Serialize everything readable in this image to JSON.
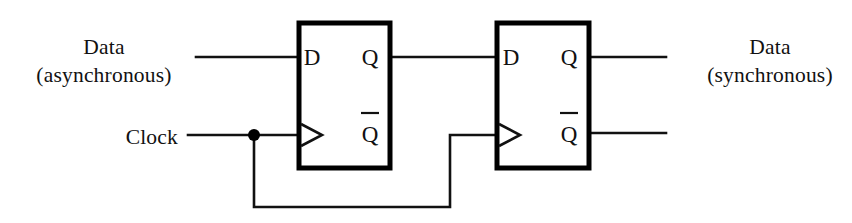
{
  "figure": {
    "type": "logic-circuit-schematic",
    "background_color": "#ffffff",
    "line_color": "#111111"
  },
  "labels": {
    "data_async": {
      "line1": "Data",
      "line2": "(asynchronous)"
    },
    "clock": "Clock",
    "data_sync": {
      "line1": "Data",
      "line2": "(synchronous)"
    }
  },
  "flipflops": [
    {
      "id": "ff1",
      "name": "first-flip-flop",
      "pins": {
        "d": "D",
        "q": "Q",
        "qbar": "Q",
        "qbar_overbar": true,
        "clock": "clock-triangle"
      }
    },
    {
      "id": "ff2",
      "name": "second-flip-flop",
      "pins": {
        "d": "D",
        "q": "Q",
        "qbar": "Q",
        "qbar_overbar": true,
        "clock": "clock-triangle"
      }
    }
  ],
  "nets": [
    {
      "name": "data-async-input-wire",
      "from": "Data (asynchronous)",
      "to": "FF1.D"
    },
    {
      "name": "clock-input-wire",
      "from": "Clock",
      "to": "FF1.CLK"
    },
    {
      "name": "clock-branch-wire",
      "from": "clock junction",
      "to": "FF2.CLK"
    },
    {
      "name": "ff1-q-to-ff2-d-wire",
      "from": "FF1.Q",
      "to": "FF2.D"
    },
    {
      "name": "ff2-q-output-wire",
      "from": "FF2.Q",
      "to": "Data (synchronous)"
    },
    {
      "name": "ff2-qbar-output-wire",
      "from": "FF2.Qbar",
      "to": "open"
    }
  ],
  "junctions": [
    {
      "name": "clock-junction-dot",
      "x": 254,
      "y": 135
    }
  ]
}
